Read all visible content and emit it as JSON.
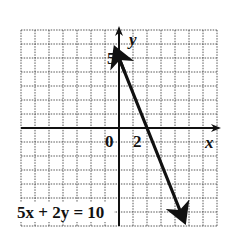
{
  "chart_data": {
    "type": "line",
    "title": "",
    "equation_label": "5x + 2y = 10",
    "xlabel": "x",
    "ylabel": "y",
    "xlim": [
      -7,
      7
    ],
    "ylim": [
      -7,
      7
    ],
    "grid": true,
    "tick_labels": [
      {
        "axis": "y",
        "value": 5,
        "text": "5"
      },
      {
        "axis": "x",
        "value": 0,
        "text": "0"
      },
      {
        "axis": "x",
        "value": 2,
        "text": "2"
      }
    ],
    "series": [
      {
        "name": "5x + 2y = 10",
        "slope": -2.5,
        "intercept": 5,
        "points": [
          {
            "x": 0,
            "y": 5
          },
          {
            "x": 2,
            "y": 0
          }
        ],
        "extent_x": [
          -0.2,
          4.6
        ],
        "arrows": "both"
      }
    ]
  }
}
